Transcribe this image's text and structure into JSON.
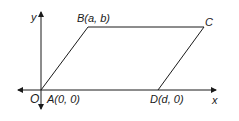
{
  "diagram": {
    "type": "parallelogram-on-axes",
    "axes": {
      "x_label": "x",
      "y_label": "y",
      "origin_label": "O"
    },
    "points": {
      "A": {
        "label": "A(0, 0)"
      },
      "B": {
        "label": "B(a, b)"
      },
      "C": {
        "label": "C"
      },
      "D": {
        "label": "D(d, 0)"
      }
    },
    "colors": {
      "stroke": "#1a1a1a",
      "background": "#ffffff"
    }
  }
}
